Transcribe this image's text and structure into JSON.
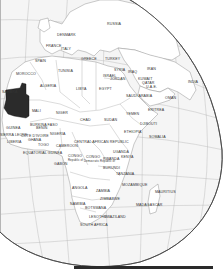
{
  "map": {
    "projection": "orthographic globe",
    "highlight_country": "Mauritania",
    "highlight_color": "#2b2b2b",
    "land_color": "#ffffff",
    "ocean_color": "#f4f4f4",
    "border_color": "#9a9a9a",
    "graticule_color": "#a8a8a8"
  },
  "labels": {
    "russia": "RUSSIA",
    "denmark": "DENMARK",
    "france": "FRANCE",
    "italy": "ITALY",
    "spain": "SPAIN",
    "greece": "GREECE",
    "turkey": "TURKEY",
    "morocco": "MOROCCO",
    "tunisia": "TUNISIA",
    "algeria": "ALGERIA",
    "libya": "LIBYA",
    "egypt": "EGYPT",
    "syria": "SYRIA",
    "israel": "ISRAEL",
    "jordan": "JORDAN",
    "iraq": "IRAQ",
    "iran": "IRAN",
    "kuwait": "KUWAIT",
    "qatar": "QATAR",
    "uae": "U.A.E.",
    "saudi_arabia": "SAUDI ARABIA",
    "oman": "OMAN",
    "india": "INDIA",
    "yemen": "YEMEN",
    "eritrea": "ERITREA",
    "djibouti": "DJIBOUTI",
    "ethiopia": "ETHIOPIA",
    "somalia": "SOMALIA",
    "sahara": "SAHARA",
    "mali": "MALI",
    "niger": "NIGER",
    "chad": "CHAD",
    "sudan": "SUDAN",
    "guinea": "GUINEA",
    "sierra_leone": "SIERRA LEONE",
    "liberia": "LIBERIA",
    "cote_divoire": "COTE D'IVOIRE",
    "ghana": "GHANA",
    "burkina_faso": "BURKINA FASO",
    "benin": "BENIN",
    "togo": "TOGO",
    "nigeria": "NIGERIA",
    "cameroon": "CAMEROON",
    "central_african_republic": "CENTRAL AFRICAN REPUBLIC",
    "equatorial_guinea": "EQUATORIAL GUINEA",
    "gabon": "GABON",
    "congo": "CONGO",
    "congo_sub": "Republic of",
    "dr_congo": "CONGO",
    "dr_congo_sub": "Democratic Republic of",
    "uganda": "UGANDA",
    "kenya": "KENYA",
    "rwanda": "RWANDA",
    "burundi": "BURUNDI",
    "tanzania": "TANZANIA",
    "angola": "ANGOLA",
    "zambia": "ZAMBIA",
    "zimbabwe": "ZIMBABWE",
    "mozambique": "MOZAMBIQUE",
    "namibia": "NAMIBIA",
    "botswana": "BOTSWANA",
    "lesotho": "LESOTHO",
    "swaziland": "SWAZILAND",
    "south_africa": "SOUTH AFRICA",
    "madagascar": "MADAGASCAR",
    "mauritius": "MAURITIUS",
    "yemen2": "YEMEN"
  }
}
